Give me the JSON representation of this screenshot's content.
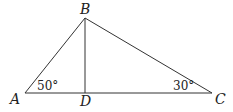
{
  "diagram": {
    "type": "triangle-with-altitude",
    "points": {
      "A": {
        "label": "A",
        "x": 25,
        "y": 93
      },
      "B": {
        "label": "B",
        "x": 85,
        "y": 18
      },
      "C": {
        "label": "C",
        "x": 212,
        "y": 93
      },
      "D": {
        "label": "D",
        "x": 85,
        "y": 93
      }
    },
    "segments": [
      "AB",
      "BC",
      "AC",
      "BD"
    ],
    "angles": {
      "A": {
        "label": "50°"
      },
      "C": {
        "label": "30°"
      }
    },
    "colors": {
      "stroke": "#333333",
      "text": "#222222",
      "background": "#ffffff"
    }
  }
}
